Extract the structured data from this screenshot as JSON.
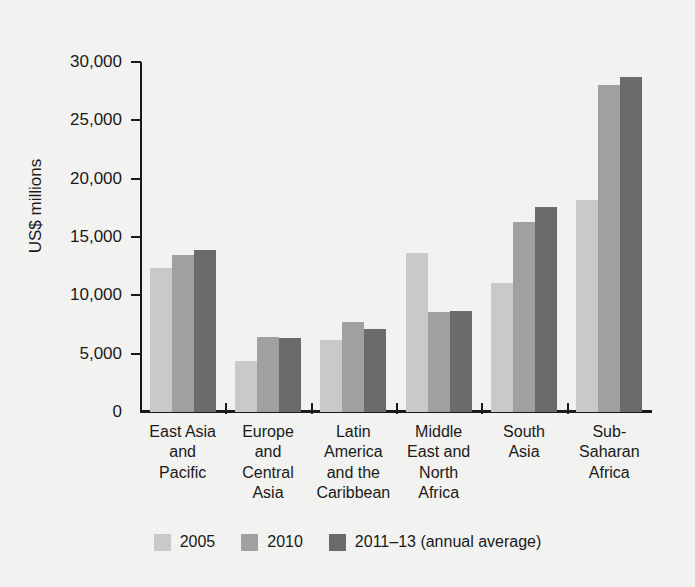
{
  "chart_data": {
    "type": "bar",
    "title": "",
    "xlabel": "",
    "ylabel": "US$ millions",
    "ylim": [
      0,
      30000
    ],
    "ytick_labels": [
      "30,000",
      "25,000",
      "20,000",
      "15,000",
      "10,000",
      "5,000",
      "0"
    ],
    "ytick_values": [
      30000,
      25000,
      20000,
      15000,
      10000,
      5000,
      0
    ],
    "grid": false,
    "legend_position": "bottom",
    "categories": [
      "East Asia\nand\nPacific",
      "Europe\nand\nCentral\nAsia",
      "Latin\nAmerica\nand the\nCaribbean",
      "Middle\nEast and\nNorth\nAfrica",
      "South\nAsia",
      "Sub-\nSaharan\nAfrica"
    ],
    "series": [
      {
        "name": "2005",
        "color": "#c9c9c7",
        "values": [
          12350,
          4350,
          6200,
          13650,
          11100,
          18150
        ]
      },
      {
        "name": "2010",
        "color": "#a0a09e",
        "values": [
          13500,
          6400,
          7750,
          8600,
          16300,
          28050
        ]
      },
      {
        "name": "2011–13 (annual average)",
        "color": "#6b6b6b",
        "values": [
          13850,
          6350,
          7150,
          8700,
          17550,
          28700
        ]
      }
    ]
  },
  "axis": {
    "y_title": "US$ millions"
  },
  "legend": {
    "items": [
      {
        "label": "2005",
        "color": "#c9c9c7"
      },
      {
        "label": "2010",
        "color": "#a0a09e"
      },
      {
        "label": "2011–13 (annual average)",
        "color": "#6b6b6b"
      }
    ]
  },
  "colors": {
    "background": "#f2f2f0",
    "axis": "#1a1a1a",
    "text": "#1a1a1a"
  }
}
